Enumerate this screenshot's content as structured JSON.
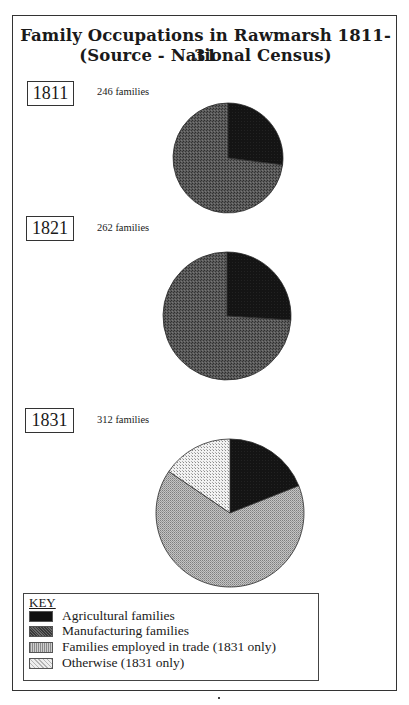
{
  "title_line1": "Family Occupations in Rawmarsh 1811-31",
  "title_line2": "(Source - National Census)",
  "colors": {
    "agricultural": "#111111",
    "manufacturing": "#4d4d4d",
    "trade": "#a9a9a9",
    "otherwise": "#e4e4e4"
  },
  "years": [
    {
      "year": "1811",
      "count_label": "246 families"
    },
    {
      "year": "1821",
      "count_label": "262 families"
    },
    {
      "year": "1831",
      "count_label": "312 families"
    }
  ],
  "key": {
    "title": "KEY",
    "items": [
      {
        "label": "Agricultural families",
        "swatch": "agricultural"
      },
      {
        "label": "Manufacturing families",
        "swatch": "manufacturing"
      },
      {
        "label": "Families employed in trade (1831 only)",
        "swatch": "trade"
      },
      {
        "label": "Otherwise (1831 only)",
        "swatch": "otherwise"
      }
    ]
  },
  "chart_data": [
    {
      "type": "pie",
      "title": "1811",
      "subtitle": "246 families",
      "categories": [
        "Agricultural families",
        "Manufacturing families"
      ],
      "values": [
        27,
        73
      ],
      "units": "percent (estimated from slice angles)",
      "start_angle": "12 o'clock, clockwise",
      "center": [
        228,
        158
      ],
      "radius": 55
    },
    {
      "type": "pie",
      "title": "1821",
      "subtitle": "262 families",
      "categories": [
        "Agricultural families",
        "Manufacturing families"
      ],
      "values": [
        26,
        74
      ],
      "units": "percent (estimated from slice angles)",
      "start_angle": "12 o'clock, clockwise",
      "center": [
        227,
        316
      ],
      "radius": 64
    },
    {
      "type": "pie",
      "title": "1831",
      "subtitle": "312 families",
      "categories": [
        "Agricultural families",
        "Families employed in trade",
        "Otherwise"
      ],
      "values": [
        19,
        65.5,
        15.5
      ],
      "units": "percent (estimated from slice angles)",
      "start_angle": "12 o'clock, clockwise",
      "center": [
        230,
        513
      ],
      "radius": 74
    }
  ]
}
